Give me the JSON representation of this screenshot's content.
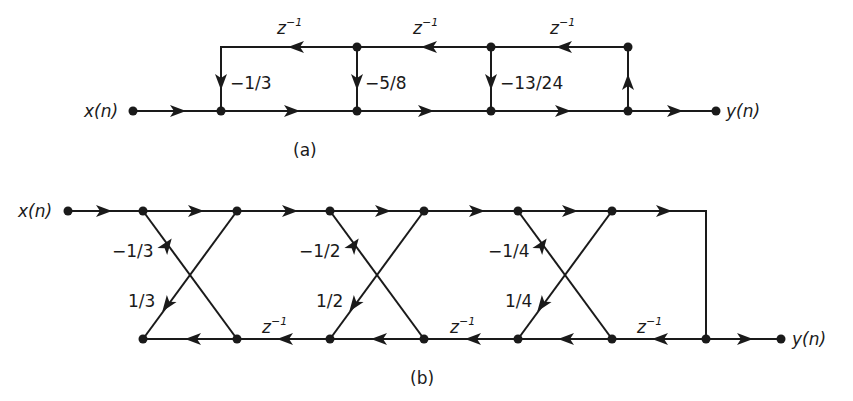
{
  "diagram_a": {
    "caption": "(a)",
    "input_label": "x(n)",
    "output_label": "y(n)",
    "delay_label_base": "z",
    "delay_label_exp": "−1",
    "coefficients": [
      "−1/3",
      "−5/8",
      "−13/24"
    ]
  },
  "diagram_b": {
    "caption": "(b)",
    "input_label": "x(n)",
    "output_label": "y(n)",
    "delay_label_base": "z",
    "delay_label_exp": "−1",
    "stages": [
      {
        "upper_coef": "−1/3",
        "lower_coef": "1/3"
      },
      {
        "upper_coef": "−1/2",
        "lower_coef": "1/2"
      },
      {
        "upper_coef": "−1/4",
        "lower_coef": "1/4"
      }
    ]
  },
  "colors": {
    "line": "#1a1a1a",
    "background": "#ffffff"
  }
}
